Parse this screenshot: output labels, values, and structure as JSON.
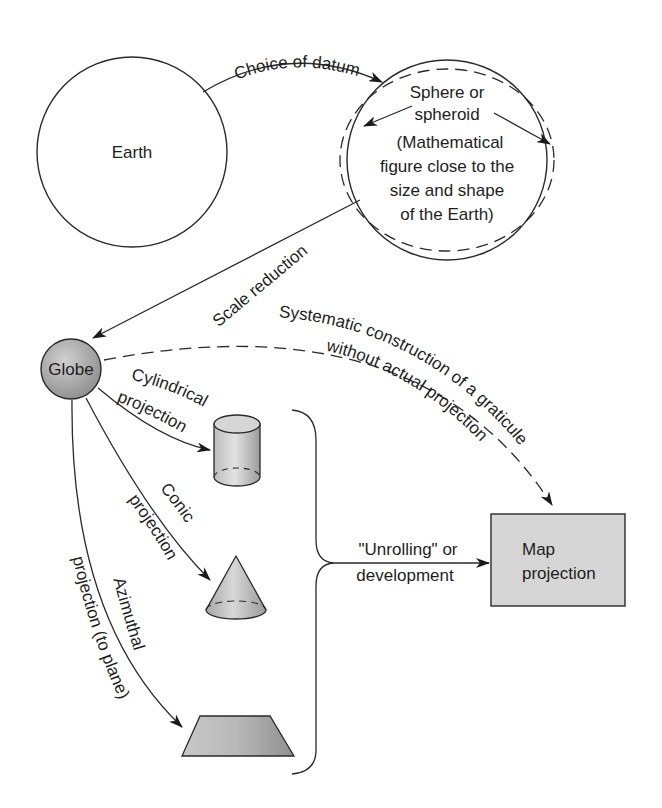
{
  "nodes": {
    "earth": {
      "label": "Earth"
    },
    "sphere": {
      "lines": [
        "Sphere or",
        "spheroid",
        "(Mathematical",
        "figure close to the",
        "size and shape",
        "of the Earth)"
      ]
    },
    "globe": {
      "label": "Globe"
    },
    "map_projection": {
      "lines": [
        "Map",
        "projection"
      ]
    }
  },
  "edges": {
    "choice_of_datum": "Choice of datum",
    "scale_reduction": "Scale reduction",
    "systematic_1": "Systematic construction of a graticule",
    "systematic_2": "without actual projection",
    "cylindrical_1": "Cylindrical",
    "cylindrical_2": "projection",
    "conic_1": "Conic",
    "conic_2": "projection",
    "azimuthal_1": "Azimuthal",
    "azimuthal_2": "projection (to plane)",
    "unrolling_1": "\"Unrolling\" or",
    "unrolling_2": "development"
  },
  "colors": {
    "shape_fill": "#c4c4c4",
    "box_fill": "#d6d6d6",
    "stroke": "#2a2a2a"
  }
}
